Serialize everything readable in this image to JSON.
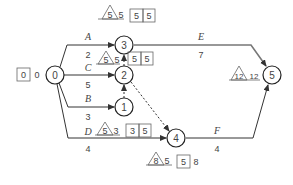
{
  "diagram": {
    "type": "activity-on-arrow network",
    "colors": {
      "line": "#333333",
      "dashed": "#333333",
      "text": "#444444",
      "node_stroke": "#222222"
    },
    "nodes": [
      {
        "id": "0",
        "label": "0",
        "x": 55,
        "y": 75
      },
      {
        "id": "1",
        "label": "1",
        "x": 124,
        "y": 107
      },
      {
        "id": "2",
        "label": "2",
        "x": 124,
        "y": 75
      },
      {
        "id": "3",
        "label": "3",
        "x": 124,
        "y": 45
      },
      {
        "id": "4",
        "label": "4",
        "x": 176,
        "y": 138
      },
      {
        "id": "5",
        "label": "5",
        "x": 272,
        "y": 75
      }
    ],
    "activities": [
      {
        "name": "A",
        "duration": "2",
        "from": "0",
        "to": "3"
      },
      {
        "name": "C",
        "duration": "5",
        "from": "0",
        "to": "2"
      },
      {
        "name": "B",
        "duration": "3",
        "from": "0",
        "to": "1"
      },
      {
        "name": "D",
        "duration": "4",
        "from": "0",
        "to": "4"
      },
      {
        "name": "E",
        "duration": "7",
        "from": "3",
        "to": "5"
      },
      {
        "name": "F",
        "duration": "4",
        "from": "4",
        "to": "5"
      }
    ],
    "dummies": [
      {
        "from": "1",
        "to": "2"
      },
      {
        "from": "2",
        "to": "3"
      },
      {
        "from": "2",
        "to": "4"
      }
    ],
    "node_times": {
      "0": {
        "box": [
          "0"
        ],
        "plain": "0"
      },
      "3": {
        "triangle": "5",
        "plain": "5",
        "box": [
          "5",
          "5"
        ]
      },
      "2": {
        "triangle": "5",
        "plain": "5",
        "box": [
          "5",
          "5"
        ]
      },
      "1": {
        "triangle": "5",
        "plain": "3",
        "box": [
          "3",
          "5"
        ]
      },
      "4": {
        "triangle": "8",
        "plain": "5",
        "box": [
          "5",
          "8"
        ]
      },
      "5": {
        "triangle": "12",
        "plain": "12"
      }
    }
  }
}
